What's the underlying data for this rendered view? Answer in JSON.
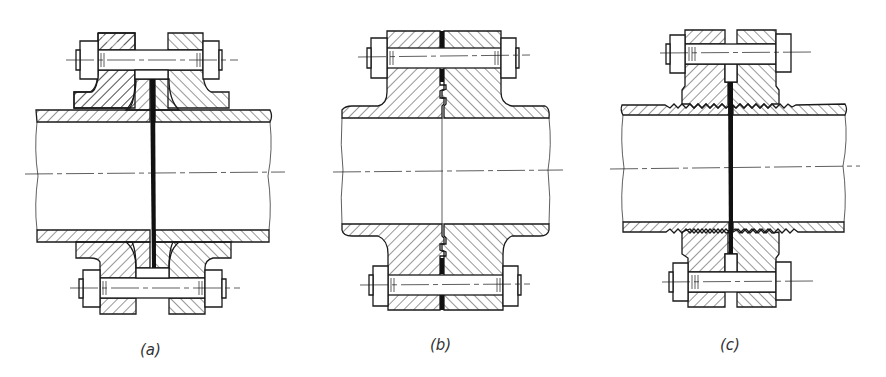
{
  "figure": {
    "panels": [
      {
        "id": "a",
        "label": "(a)",
        "type": "flanged joint with flat gasket between raised-face hubs, loose backing flanges"
      },
      {
        "id": "b",
        "label": "(b)",
        "type": "welded-neck flanges with tongue-and-groove spigot, ring gasket at bolt circle"
      },
      {
        "id": "c",
        "label": "(c)",
        "type": "screwed (threaded) flanges with full-face gasket"
      }
    ]
  },
  "colors": {
    "background": "#ffffff",
    "line": "#1a1a1a",
    "gasket": "#111111",
    "label": "#333333"
  }
}
